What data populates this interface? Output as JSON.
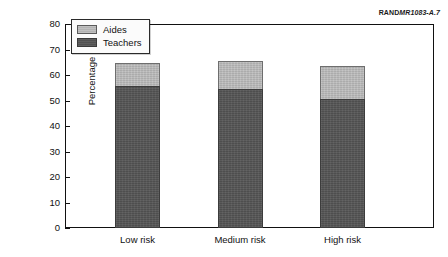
{
  "credit": {
    "org": "RAND",
    "document": "MR1083-A.7"
  },
  "chart_data": {
    "type": "bar",
    "subtype": "stacked-bar",
    "title": "",
    "xlabel": "",
    "ylabel": "Percentage of staff",
    "categories": [
      "Low risk",
      "Medium risk",
      "High risk"
    ],
    "series": [
      {
        "name": "Teachers",
        "values": [
          55.7,
          54.5,
          50.5
        ],
        "color": "#555555"
      },
      {
        "name": "Aides",
        "values": [
          9.0,
          11.0,
          13.0
        ],
        "color": "#b9b9b9"
      }
    ],
    "totals": [
      64.7,
      65.5,
      63.5
    ],
    "ylim": [
      0,
      80
    ],
    "yticks": [
      0,
      10,
      20,
      30,
      40,
      50,
      60,
      70,
      80
    ],
    "ytick_labels": [
      "0",
      "10",
      "20",
      "30",
      "40",
      "50",
      "60",
      "70",
      "80"
    ],
    "grid": false,
    "legend_position": "top-left",
    "legend_entries": [
      "Aides",
      "Teachers"
    ]
  }
}
